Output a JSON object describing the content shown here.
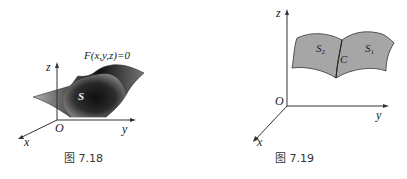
{
  "figures": [
    {
      "caption": "图 7.18",
      "equation": "F(x,y,z)=0",
      "surface_label": "S",
      "axes": {
        "x": "x",
        "y": "y",
        "z": "z",
        "origin": "O"
      }
    },
    {
      "caption": "图 7.19",
      "surface_labels": {
        "s1": "S",
        "s1_sub": "1",
        "s2": "S",
        "s2_sub": "2"
      },
      "curve_label": "C",
      "axes": {
        "x": "x",
        "y": "y",
        "z": "z",
        "origin": "O"
      }
    }
  ],
  "colors": {
    "surface_dark": "#1a1a1a",
    "surface_light": "#8a8a8a",
    "surface_gray": "#a6a6a6",
    "axis": "#333333"
  }
}
